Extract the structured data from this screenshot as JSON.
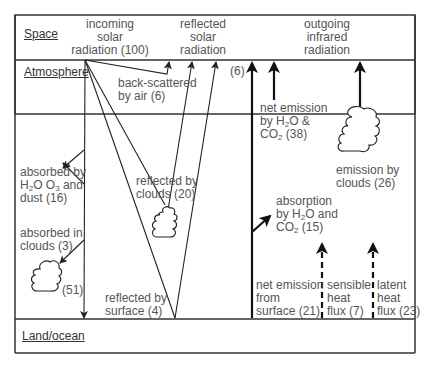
{
  "zones": {
    "space": "Space",
    "atmosphere": "Atmosphere",
    "land": "Land/ocean"
  },
  "top_labels": {
    "incoming": [
      "incoming",
      "solar",
      "radiation (100)"
    ],
    "reflected": [
      "reflected",
      "solar",
      "radiation"
    ],
    "outgoing": [
      "outgoing",
      "infrared",
      "radiation"
    ]
  },
  "solar_labels": {
    "backscatter": [
      "back-scattered",
      "by air (6)"
    ],
    "absorbed_h2o": [
      "absorbed by",
      "H",
      "2",
      "O O",
      "3",
      " and",
      "dust (16)"
    ],
    "absorbed_clouds": [
      "absorbed in",
      "clouds (3)"
    ],
    "reflected_clouds": [
      "reflected by",
      "clouds (20)"
    ],
    "surface_direct": "(51)",
    "reflected_surface": [
      "reflected by",
      "surface (4)"
    ]
  },
  "infrared_labels": {
    "six": "(6)",
    "net_emission_h2o": [
      "net emission",
      "by H",
      "2",
      "O &",
      "CO",
      "2",
      " (38)"
    ],
    "emission_clouds": [
      "emission by",
      "clouds (26)"
    ],
    "absorption": [
      "absorption",
      "by H",
      "2",
      "O and",
      "CO",
      "2",
      " (15)"
    ],
    "net_surface": [
      "net emission",
      "from",
      "surface (21)"
    ],
    "sensible": [
      "sensible",
      "heat",
      "flux (7)"
    ],
    "latent": [
      "latent",
      "heat",
      "flux (23)"
    ]
  },
  "colors": {
    "line": "#222222",
    "text": "#555555"
  }
}
